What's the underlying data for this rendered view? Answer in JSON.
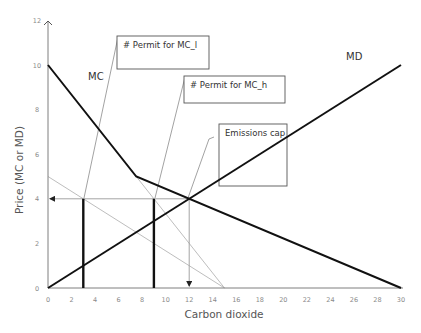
{
  "chart_data": {
    "type": "line",
    "title": "",
    "xlabel": "Carbon dioxide",
    "ylabel": "Price (MC or MD)",
    "xlim": [
      0,
      30
    ],
    "ylim": [
      0,
      12
    ],
    "grid": false,
    "x_ticks": [
      "0",
      "2",
      "4",
      "6",
      "8",
      "10",
      "12",
      "14",
      "16",
      "18",
      "20",
      "22",
      "24",
      "26",
      "28",
      "30"
    ],
    "y_ticks": [
      "0",
      "2",
      "4",
      "6",
      "8",
      "10",
      "12"
    ],
    "series": [
      {
        "name": "MC",
        "style": "thick-black",
        "points": [
          [
            0,
            10
          ],
          [
            7.5,
            5
          ],
          [
            30,
            0
          ]
        ]
      },
      {
        "name": "MD",
        "style": "thick-black",
        "points": [
          [
            0,
            0
          ],
          [
            30,
            10
          ]
        ]
      },
      {
        "name": "MC_l",
        "style": "thin-gray",
        "points": [
          [
            0,
            5
          ],
          [
            15,
            0
          ]
        ]
      },
      {
        "name": "MC_h",
        "style": "thin-gray",
        "points": [
          [
            7.5,
            5
          ],
          [
            15,
            0
          ]
        ]
      }
    ],
    "reference_lines": [
      {
        "name": "price-at-cap",
        "type": "horizontal-arrow",
        "from": [
          12,
          4
        ],
        "to": [
          0,
          4
        ]
      },
      {
        "name": "cap-quantity",
        "type": "vertical-arrow",
        "from": [
          12,
          4
        ],
        "to": [
          12,
          0
        ]
      },
      {
        "name": "permit-MC_l",
        "type": "vertical-thick",
        "x": 3,
        "y_range": [
          0,
          4
        ]
      },
      {
        "name": "permit-MC_h",
        "type": "vertical-thick",
        "x": 9,
        "y_range": [
          0,
          4
        ]
      }
    ],
    "annotations": [
      {
        "text": "MC",
        "x": 3.5,
        "y": 9.3
      },
      {
        "text": "MD",
        "x": 25.5,
        "y": 10.4
      },
      {
        "text": "# Permit for MC_l",
        "target": [
          3,
          4
        ]
      },
      {
        "text": "# Permit for MC_h",
        "target": [
          9,
          4
        ]
      },
      {
        "text": "Emissions cap",
        "target": [
          12,
          4
        ]
      }
    ]
  },
  "labels": {
    "mc": "MC",
    "md": "MD",
    "xlabel": "Carbon dioxide",
    "ylabel": "Price (MC or MD)",
    "callout_mcl": "# Permit for MC_l",
    "callout_mch": "# Permit for MC_h",
    "callout_cap": "Emissions cap"
  },
  "colors": {
    "axis": "#7f7f7f",
    "main_line": "#111111",
    "gray_line": "#b5b5b5",
    "ref_line": "#9a9a9a",
    "box_border": "#555555"
  }
}
